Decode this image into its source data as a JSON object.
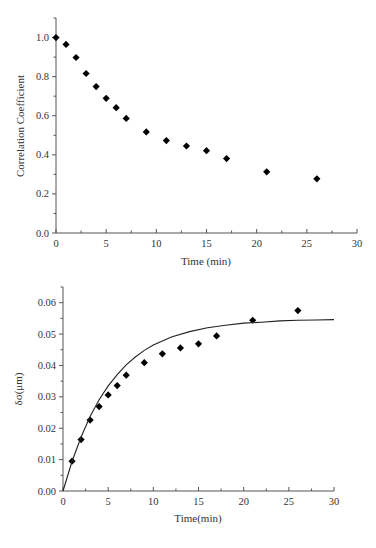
{
  "chart_data": [
    {
      "type": "scatter",
      "title": "",
      "xlabel": "Time (min)",
      "ylabel": "Correlation Coefficient",
      "xlim": [
        0,
        30
      ],
      "ylim": [
        0,
        1.1
      ],
      "xticks": [
        0,
        5,
        10,
        15,
        20,
        25,
        30
      ],
      "xtick_labels": [
        "0",
        "5",
        "10",
        "15",
        "20",
        "25",
        "30"
      ],
      "yticks": [
        0.0,
        0.2,
        0.4,
        0.6,
        0.8,
        1.0
      ],
      "ytick_labels": [
        "0.0",
        "0.2",
        "0.4",
        "0.6",
        "0.8",
        "1.0"
      ],
      "x_minor_step": 2.5,
      "y_minor_step": 0.1,
      "grid": false,
      "legend": null,
      "series": [
        {
          "name": "Correlation Coefficient",
          "marker": "diamond",
          "color": "#000000",
          "x": [
            0,
            1,
            2,
            3,
            4,
            5,
            6,
            7,
            9,
            11,
            13,
            15,
            17,
            21,
            26
          ],
          "y": [
            1.0,
            0.965,
            0.898,
            0.816,
            0.749,
            0.689,
            0.641,
            0.586,
            0.517,
            0.473,
            0.445,
            0.421,
            0.381,
            0.313,
            0.277
          ]
        }
      ]
    },
    {
      "type": "scatter",
      "title": "",
      "xlabel": "Time(min)",
      "ylabel": "δσ(μm)",
      "xlim": [
        0,
        30
      ],
      "ylim": [
        0,
        0.065
      ],
      "xticks": [
        0,
        5,
        10,
        15,
        20,
        25,
        30
      ],
      "xtick_labels": [
        "0",
        "5",
        "10",
        "15",
        "20",
        "25",
        "30"
      ],
      "yticks": [
        0.0,
        0.01,
        0.02,
        0.03,
        0.04,
        0.05,
        0.06
      ],
      "ytick_labels": [
        "0.00",
        "0.01",
        "0.02",
        "0.03",
        "0.04",
        "0.05",
        "0.06"
      ],
      "x_minor_step": 2.5,
      "y_minor_step": 0.005,
      "grid": false,
      "legend": null,
      "series": [
        {
          "name": "Measured δσ",
          "marker": "diamond",
          "color": "#000000",
          "x": [
            1,
            2,
            3,
            4,
            5,
            6,
            7,
            9,
            11,
            13,
            15,
            17,
            21,
            26
          ],
          "y": [
            0.0095,
            0.0164,
            0.0226,
            0.0269,
            0.0306,
            0.0336,
            0.0369,
            0.0409,
            0.0437,
            0.0456,
            0.0469,
            0.0494,
            0.0544,
            0.0575
          ]
        },
        {
          "name": "Fitted curve",
          "line": "solid",
          "color": "#222222",
          "model": "a*(1-exp(-t/tau))",
          "params": {
            "a": 0.0548,
            "tau": 5.3
          },
          "x": [
            0,
            1,
            2,
            3,
            4,
            5,
            6,
            7,
            8,
            9,
            10,
            12,
            14,
            16,
            18,
            20,
            22,
            24,
            26,
            28,
            30
          ],
          "y": [
            0.0,
            0.0094,
            0.0172,
            0.0237,
            0.0291,
            0.0335,
            0.0371,
            0.0402,
            0.0427,
            0.0448,
            0.0465,
            0.0491,
            0.0508,
            0.052,
            0.0528,
            0.0535,
            0.0538,
            0.0542,
            0.0544,
            0.0545,
            0.0546
          ]
        }
      ]
    }
  ],
  "layout": {
    "plots": [
      {
        "x0": 56,
        "x1": 357,
        "y0": 233,
        "ytop": 18,
        "ymax_px_value": 1.1
      },
      {
        "x0": 63,
        "x1": 334,
        "y0": 491,
        "ytop": 287,
        "ymax_px_value": 0.065
      }
    ]
  }
}
